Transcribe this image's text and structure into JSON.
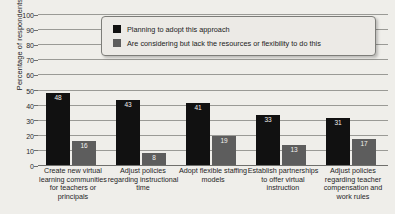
{
  "chart_data": {
    "type": "bar",
    "title": "",
    "xlabel": "",
    "ylabel": "Percentage of respondents",
    "ylim": [
      0,
      100
    ],
    "ytick_step": 10,
    "yticks": [
      0,
      10,
      20,
      30,
      40,
      50,
      60,
      70,
      80,
      90,
      100
    ],
    "grid": true,
    "legend_position": "top-center",
    "categories": [
      "Create new virtual learning communities for teachers or principals",
      "Adjust policies regarding instructional time",
      "Adopt flexible staffing models",
      "Establish partnerships to offer virtual instruction",
      "Adjust policies regarding teacher compensation and work rules"
    ],
    "series": [
      {
        "name": "Planning to adopt this approach",
        "color": "#111111",
        "values": [
          48,
          43,
          41,
          33,
          31
        ]
      },
      {
        "name": "Are considering but lack the resources or flexibility to do this",
        "color": "#5d5d5d",
        "values": [
          16,
          8,
          19,
          13,
          17
        ]
      }
    ]
  },
  "legend": {
    "items": [
      {
        "label": "Planning to adopt this approach",
        "swatch": "legend-swatch-planning"
      },
      {
        "label": "Are considering but lack the resources or flexibility to do this",
        "swatch": "legend-swatch-considering"
      }
    ]
  },
  "colors": {
    "background": "#efeeea",
    "series_planning": "#111111",
    "series_considering": "#5d5d5d",
    "gridline": "#9a9a96",
    "axis": "#6f6f6c",
    "text": "#1a1a1a"
  }
}
